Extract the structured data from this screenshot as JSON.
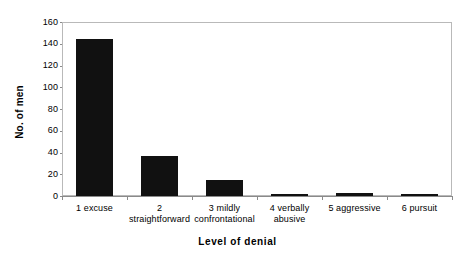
{
  "chart_data": {
    "type": "bar",
    "title": "",
    "xlabel": "Level of denial",
    "ylabel": "No. of men",
    "categories": [
      "1 excuse",
      "2 straightforward",
      "3 mildly confrontational",
      "4 verbally abusive",
      "5 aggressive",
      "6 pursuit"
    ],
    "category_lines": [
      [
        "1 excuse"
      ],
      [
        "2",
        "straightforward"
      ],
      [
        "3 mildly",
        "confrontational"
      ],
      [
        "4 verbally",
        "abusive"
      ],
      [
        "5 aggressive"
      ],
      [
        "6 pursuit"
      ]
    ],
    "values": [
      144,
      37,
      15,
      2,
      3,
      2
    ],
    "ylim": [
      0,
      160
    ],
    "yticks": [
      0,
      20,
      40,
      60,
      80,
      100,
      120,
      140,
      160
    ],
    "ytick_labels": [
      "0",
      "20",
      "40",
      "60",
      "80",
      "100",
      "120",
      "140",
      "160"
    ],
    "grid": false,
    "legend": false,
    "bar_color": "#111111",
    "frame_color": "#b9b9b9",
    "axis_color": "#8a8a8a",
    "background": "#ffffff"
  }
}
